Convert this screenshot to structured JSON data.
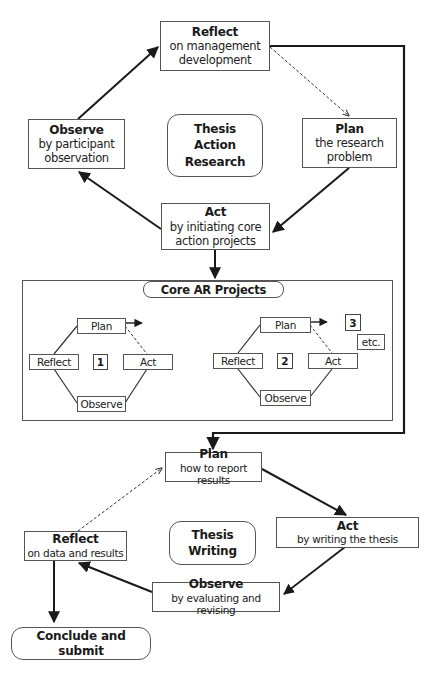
{
  "thesis_action_research": {
    "center_label": [
      "Thesis",
      "Action",
      "Research"
    ],
    "reflect": {
      "title": "Reflect",
      "lines": [
        "on management",
        "development"
      ]
    },
    "plan": {
      "title": "Plan",
      "lines": [
        "the research",
        "problem"
      ]
    },
    "act": {
      "title": "Act",
      "lines": [
        "by initiating core",
        "action projects"
      ]
    },
    "observe": {
      "title": "Observe",
      "lines": [
        "by participant",
        "observation"
      ]
    }
  },
  "core_ar_projects": {
    "title": "Core AR Projects",
    "project_1": {
      "number": "1",
      "plan": "Plan",
      "act": "Act",
      "observe": "Observe",
      "reflect": "Reflect"
    },
    "project_2": {
      "number": "2",
      "plan": "Plan",
      "act": "Act",
      "observe": "Observe",
      "reflect": "Reflect"
    },
    "project_3": {
      "number": "3",
      "etc": "etc."
    }
  },
  "thesis_writing": {
    "center_label": [
      "Thesis",
      "Writing"
    ],
    "plan": {
      "title": "Plan",
      "lines": [
        "how to report results"
      ]
    },
    "act": {
      "title": "Act",
      "lines": [
        "by writing the thesis"
      ]
    },
    "observe": {
      "title": "Observe",
      "lines": [
        "by evaluating and revising"
      ]
    },
    "reflect": {
      "title": "Reflect",
      "lines": [
        "on data and results"
      ]
    }
  },
  "conclude": {
    "label": "Conclude and submit"
  },
  "colors": {
    "line": "#1a1a1a",
    "border": "#555555",
    "background": "#ffffff"
  }
}
